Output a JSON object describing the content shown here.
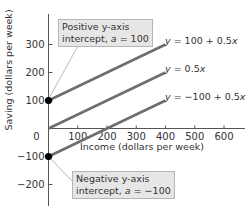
{
  "chart_data": {
    "type": "line",
    "title": "",
    "xlabel": "Income (dollars per week)",
    "ylabel": "Saving (dollars per week)",
    "xlim": [
      0,
      650
    ],
    "ylim": [
      -280,
      390
    ],
    "x_ticks": [
      100,
      200,
      300,
      400,
      500,
      600
    ],
    "y_ticks": [
      -200,
      -100,
      0,
      100,
      200,
      300
    ],
    "x_tick_labels": [
      "100",
      "200",
      "300",
      "400",
      "500",
      "600"
    ],
    "y_tick_labels": [
      "−200",
      "−100",
      "0",
      "100",
      "200",
      "300"
    ],
    "grid": false,
    "series": [
      {
        "name": "y = 100 + 0.5x",
        "x": [
          0,
          400
        ],
        "y": [
          100,
          300
        ]
      },
      {
        "name": "y = 0.5x",
        "x": [
          0,
          400
        ],
        "y": [
          0,
          200
        ]
      },
      {
        "name": "y = −100 + 0.5x",
        "x": [
          0,
          400
        ],
        "y": [
          -100,
          100
        ]
      }
    ],
    "points": [
      {
        "x": 0,
        "y": 100,
        "label": "Positive y-axis intercept, a = 100"
      },
      {
        "x": 0,
        "y": -100,
        "label": "Negative y-axis intercept, a = −100"
      }
    ],
    "annotations": [
      {
        "line1": "Positive y-axis",
        "line2_prefix": "intercept, ",
        "var": "a",
        "line2_suffix": " = 100"
      },
      {
        "line1": "Negative y-axis",
        "line2_prefix": "intercept, ",
        "var": "a",
        "line2_suffix": " = −100"
      }
    ],
    "line_color": "#6e6e6e",
    "point_color": "#000000"
  },
  "labels": {
    "x_axis_title": "Income (dollars per week)",
    "y_axis_title": "Saving (dollars per week)",
    "eq1": "y = 100 + 0.5x",
    "eq2": "y = 0.5x",
    "eq3": "y = −100 + 0.5x",
    "zero": "0",
    "callout_top_l1": "Positive y-axis",
    "callout_top_l2a": "intercept, ",
    "callout_top_var": "a",
    "callout_top_l2b": " = 100",
    "callout_bot_l1": "Negative y-axis",
    "callout_bot_l2a": "intercept, ",
    "callout_bot_var": "a",
    "callout_bot_l2b": " = −100"
  }
}
